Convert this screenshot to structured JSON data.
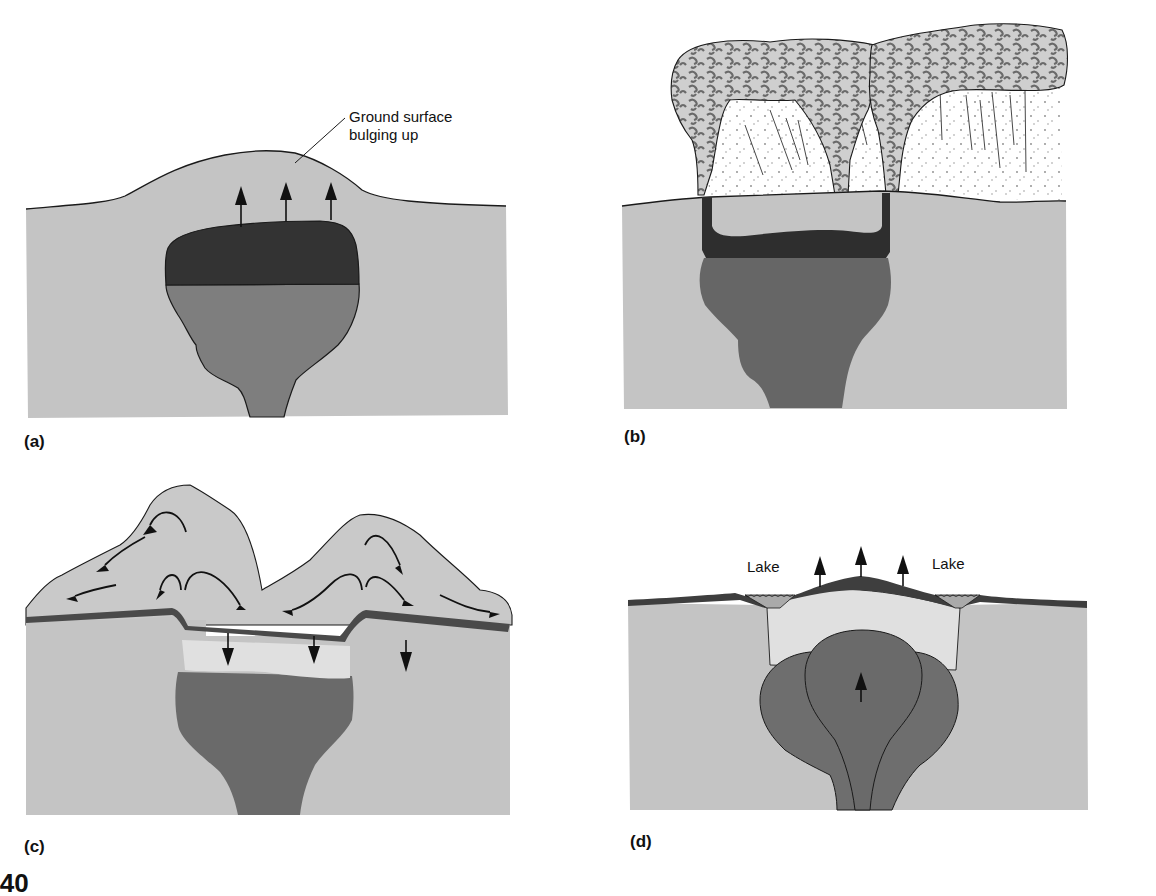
{
  "figure": {
    "number_fragment": "3.40",
    "type": "Cross-section diagram sequence of a resurgent caldera formation"
  },
  "colors": {
    "background": "#ffffff",
    "country_rock": "#c4c4c4",
    "magma_upper_dark": "#3a3a3a",
    "magma_lower": "#7e7e7e",
    "magma_chamber_b": "#6a6a6a",
    "ash_cloud": "#d4d4d4",
    "ash_speckle": "#8a8a8a",
    "caldera_fill_light": "#e2e2e2",
    "surface_layer_dark": "#555555",
    "outline": "#1a1a1a"
  },
  "panels": [
    {
      "id": "a",
      "label": "(a)",
      "annotations": [
        "Ground surface",
        "bulging up"
      ],
      "description": "Magma chamber rises, ground surface bulges up; three upward arrows"
    },
    {
      "id": "b",
      "label": "(b)",
      "annotations": [],
      "description": "Eruption columns from ring fractures; ash clouds above, chamber partially emptied"
    },
    {
      "id": "c",
      "label": "(c)",
      "annotations": [],
      "description": "Collapse of roof into chamber; pyroclastic flows spreading outward with arrows; three downward arrows"
    },
    {
      "id": "d",
      "label": "(d)",
      "annotations": [
        "Lake",
        "Lake"
      ],
      "description": "Resurgent dome uplift; lakes in moat; new magma rising with arrow; three upward arrows at surface"
    }
  ]
}
